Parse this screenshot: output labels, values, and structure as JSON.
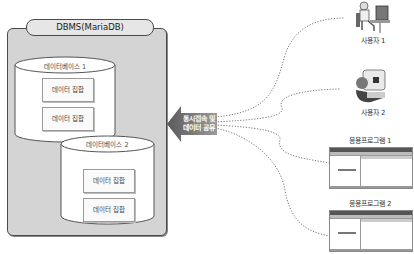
{
  "dbms": {
    "title": "DBMS(MariaDB)",
    "databases": [
      {
        "label": "데이터베이스 1",
        "datasets": [
          "데이터 집합",
          "데이터 집합"
        ]
      },
      {
        "label": "데이터베이스 2",
        "datasets": [
          "데이터 집합",
          "데이터 집합"
        ]
      }
    ]
  },
  "arrow": {
    "line1": "동시접속 및",
    "line2": "데이터 공유"
  },
  "clients": {
    "users": [
      {
        "label": "사용자 1",
        "icon": "user-at-computer-icon"
      },
      {
        "label": "사용자 2",
        "icon": "user-with-monitor-icon"
      }
    ],
    "apps": [
      {
        "label": "응용프로그램 1",
        "icon": "application-window-icon"
      },
      {
        "label": "응용프로그램 2",
        "icon": "application-window-icon"
      }
    ]
  },
  "colors": {
    "box_fill": "#d4d4d4",
    "border": "#4a4a4a",
    "arrow": "#7a7a7a",
    "dotted_line": "#777777"
  }
}
